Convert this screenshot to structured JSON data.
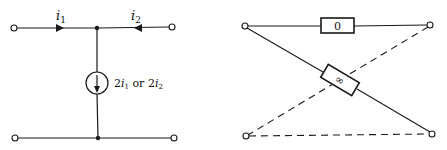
{
  "left_circuit": {
    "current_in_left": {
      "symbol": "i",
      "subscript": "1"
    },
    "current_in_right": {
      "symbol": "i",
      "subscript": "2"
    },
    "source_label": {
      "part1": "2",
      "var1": "i",
      "sub1": "1",
      "connector": " or ",
      "part2": "2",
      "var2": "i",
      "sub2": "2"
    }
  },
  "right_circuit": {
    "top_element_label": "0",
    "diagonal_element_label": "∞"
  },
  "colors": {
    "line": "#1a1a1a",
    "background": "#ffffff"
  }
}
